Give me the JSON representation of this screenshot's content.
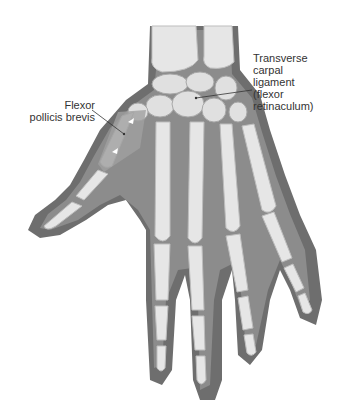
{
  "figure": {
    "colors": {
      "background": "#ffffff",
      "skin": "#6e6e6e",
      "soft_tissue": "#8c8c8c",
      "bone": "#e6e6e6",
      "bone_shadow": "#bdbdbd",
      "label_text": "#333333",
      "leader_line": "#333333"
    }
  },
  "labels": {
    "transverse_carpal_ligament": {
      "lines": [
        "Transverse",
        "carpal",
        "ligament",
        "(flexor",
        "retinaculum)"
      ]
    },
    "flexor_pollicis_brevis": {
      "lines": [
        "Flexor",
        "pollicis brevis"
      ]
    }
  }
}
